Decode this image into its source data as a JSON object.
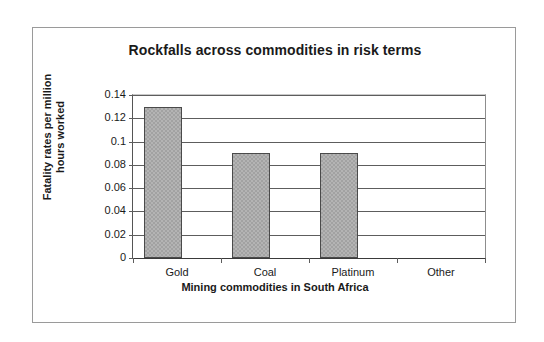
{
  "chart_data": {
    "type": "bar",
    "title": "Rockfalls across commodities in risk terms",
    "xlabel": "Mining commodities in South Africa",
    "ylabel": "Fatality rates per million hours worked",
    "categories": [
      "Gold",
      "Coal",
      "Platinum",
      "Other"
    ],
    "values": [
      0.13,
      0.09,
      0.09,
      0
    ],
    "ylim": [
      0,
      0.14
    ],
    "ytick_labels": [
      "0.14",
      "0.12",
      "0.1",
      "0.08",
      "0.06",
      "0.04",
      "0.02",
      "0"
    ],
    "ytick_values": [
      0.14,
      0.12,
      0.1,
      0.08,
      0.06,
      0.04,
      0.02,
      0
    ],
    "grid": true,
    "legend": false,
    "series": [
      {
        "name": "Fatality rate",
        "values": [
          0.13,
          0.09,
          0.09,
          0
        ]
      }
    ],
    "colors": {
      "bar_fill": "#b4b4b4",
      "bar_pattern": "#a2a2a2",
      "bar_outline": "#4a4a4a",
      "gridline": "#5d5d5d",
      "frame": "#9a9a9a",
      "text": "#1a1a1a",
      "background": "#ffffff"
    }
  },
  "ylabel_lines": {
    "line1": "Fatality rates per million",
    "line2": "hours worked"
  }
}
